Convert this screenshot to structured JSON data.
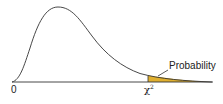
{
  "diagram": {
    "title": "",
    "type": "chi-square distribution curve with right-tail shaded area",
    "labels": {
      "origin": "0",
      "critical_value_symbol": "χ",
      "critical_value_superscript": "2",
      "shaded_area": "Probability"
    },
    "colors": {
      "curve": "#333333",
      "axis": "#333333",
      "shaded_fill": "#e0b030",
      "background": "#ffffff"
    }
  }
}
